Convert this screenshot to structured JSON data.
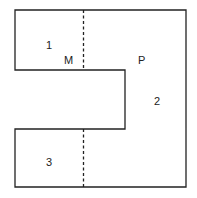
{
  "diagram": {
    "type": "floor-plan-outline",
    "colors": {
      "stroke": "#222222",
      "background": "#ffffff"
    },
    "labels": {
      "region1": "1",
      "region2": "2",
      "region3": "3",
      "pointM": "M",
      "pointP": "P"
    },
    "dividers": [
      {
        "style": "dashed",
        "orientation": "vertical",
        "between": [
          "1",
          "2"
        ]
      },
      {
        "style": "dashed",
        "orientation": "vertical",
        "between": [
          "3",
          "2"
        ]
      }
    ]
  }
}
